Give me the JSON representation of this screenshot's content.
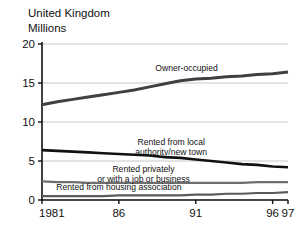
{
  "chart_data": {
    "type": "line",
    "title": "United Kingdom",
    "subtitle": "Millions",
    "ylabel": "Millions",
    "xlabel": "",
    "xlim": [
      1981,
      1997
    ],
    "ylim": [
      0,
      20
    ],
    "grid": true,
    "legend_position": "inline-annotations",
    "ytick_labels": [
      "0",
      "5",
      "10",
      "15",
      "20"
    ],
    "ytick_values": [
      0,
      5,
      10,
      15,
      20
    ],
    "xtick_labels": [
      "1981",
      "86",
      "91",
      "96",
      "97"
    ],
    "xtick_values": [
      1981,
      1986,
      1991,
      1996,
      1997
    ],
    "x": [
      1981,
      1982,
      1983,
      1984,
      1985,
      1986,
      1987,
      1988,
      1989,
      1990,
      1991,
      1992,
      1993,
      1994,
      1995,
      1996,
      1997
    ],
    "series": [
      {
        "name": "Owner-occupied",
        "color": "#404040",
        "width": 3.0,
        "values": [
          12.2,
          12.6,
          12.9,
          13.2,
          13.5,
          13.8,
          14.1,
          14.5,
          14.9,
          15.3,
          15.5,
          15.6,
          15.8,
          15.9,
          16.1,
          16.2,
          16.4
        ]
      },
      {
        "name": "Rented from local authority/new town",
        "color": "#111111",
        "width": 2.6,
        "values": [
          6.4,
          6.3,
          6.2,
          6.1,
          6.0,
          5.9,
          5.8,
          5.7,
          5.5,
          5.4,
          5.2,
          5.0,
          4.8,
          4.6,
          4.5,
          4.3,
          4.2
        ]
      },
      {
        "name": "Rented privately or with a job or business",
        "color": "#6e6e6e",
        "width": 2.2,
        "values": [
          2.4,
          2.3,
          2.3,
          2.2,
          2.2,
          2.2,
          2.2,
          2.2,
          2.2,
          2.2,
          2.2,
          2.2,
          2.2,
          2.2,
          2.3,
          2.3,
          2.3
        ]
      },
      {
        "name": "Rented from housing association",
        "color": "#5a5a5a",
        "width": 2.2,
        "values": [
          0.5,
          0.5,
          0.5,
          0.5,
          0.5,
          0.6,
          0.6,
          0.6,
          0.6,
          0.6,
          0.7,
          0.7,
          0.8,
          0.8,
          0.9,
          0.9,
          1.0
        ]
      }
    ],
    "annotations": [
      {
        "text": "Owner-occupied",
        "lines": [
          "Owner-occupied"
        ],
        "x": 1990.4,
        "y": 16.6,
        "anchor": "middle"
      },
      {
        "text": "Rented from local authority/new town",
        "lines": [
          "Rented from local",
          "authority/new town"
        ],
        "x": 1989.4,
        "y": 7.0,
        "anchor": "middle"
      },
      {
        "text": "Rented privately or with a job or business",
        "lines": [
          "Rented privately",
          "or with a job or business"
        ],
        "x": 1987.6,
        "y": 3.6,
        "anchor": "middle"
      },
      {
        "text": "Rented from housing association",
        "lines": [
          "Rented from housing association"
        ],
        "x": 1986.0,
        "y": 1.3,
        "anchor": "middle"
      }
    ]
  }
}
